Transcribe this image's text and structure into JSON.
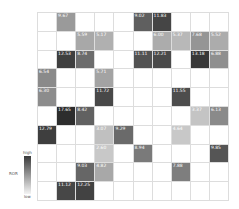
{
  "chart_data": {
    "type": "heatmap",
    "title": "",
    "rows": 10,
    "cols": 10,
    "colorbar": {
      "label": "ROR",
      "high_label": "high",
      "low_label": "low",
      "high_color": "#3a3a3a",
      "low_color": "#f4f4f4"
    },
    "cells": [
      {
        "r": 0,
        "c": 1,
        "v": "9.67",
        "shade": "#9a9a9a"
      },
      {
        "r": 0,
        "c": 5,
        "v": "9.02",
        "shade": "#5f5f5f"
      },
      {
        "r": 0,
        "c": 6,
        "v": "11.83",
        "shade": "#454545"
      },
      {
        "r": 1,
        "c": 2,
        "v": "5.59",
        "shade": "#a8a8a8"
      },
      {
        "r": 1,
        "c": 3,
        "v": "5.17",
        "shade": "#b0b0b0"
      },
      {
        "r": 1,
        "c": 6,
        "v": "6.00",
        "shade": "#acacac"
      },
      {
        "r": 1,
        "c": 7,
        "v": "5.37",
        "shade": "#b8b8b8"
      },
      {
        "r": 1,
        "c": 8,
        "v": "7.68",
        "shade": "#959595"
      },
      {
        "r": 1,
        "c": 9,
        "v": "5.52",
        "shade": "#acacac"
      },
      {
        "r": 2,
        "c": 1,
        "v": "12.53",
        "shade": "#3f3f3f"
      },
      {
        "r": 2,
        "c": 2,
        "v": "8.74",
        "shade": "#6c6c6c"
      },
      {
        "r": 2,
        "c": 5,
        "v": "11.11",
        "shade": "#525252"
      },
      {
        "r": 2,
        "c": 6,
        "v": "12.21",
        "shade": "#4a4a4a"
      },
      {
        "r": 2,
        "c": 8,
        "v": "13.18",
        "shade": "#383838"
      },
      {
        "r": 2,
        "c": 9,
        "v": "6.88",
        "shade": "#8f8f8f"
      },
      {
        "r": 3,
        "c": 0,
        "v": "6.54",
        "shade": "#8a8a8a"
      },
      {
        "r": 3,
        "c": 3,
        "v": "5.71",
        "shade": "#a3a3a3"
      },
      {
        "r": 4,
        "c": 0,
        "v": "6.30",
        "shade": "#8c8c8c"
      },
      {
        "r": 4,
        "c": 3,
        "v": "11.72",
        "shade": "#484848"
      },
      {
        "r": 4,
        "c": 7,
        "v": "11.55",
        "shade": "#4d4d4d"
      },
      {
        "r": 5,
        "c": 1,
        "v": "17.65",
        "shade": "#2d2d2d"
      },
      {
        "r": 5,
        "c": 2,
        "v": "8.42",
        "shade": "#616161"
      },
      {
        "r": 5,
        "c": 8,
        "v": "3.37",
        "shade": "#c4c4c4"
      },
      {
        "r": 5,
        "c": 9,
        "v": "6.13",
        "shade": "#8a8a8a"
      },
      {
        "r": 6,
        "c": 0,
        "v": "12.79",
        "shade": "#3e3e3e"
      },
      {
        "r": 6,
        "c": 3,
        "v": "3.07",
        "shade": "#c0c0c0"
      },
      {
        "r": 6,
        "c": 4,
        "v": "9.29",
        "shade": "#6a6a6a"
      },
      {
        "r": 6,
        "c": 7,
        "v": "4.64",
        "shade": "#c8c8c8"
      },
      {
        "r": 7,
        "c": 3,
        "v": "2.60",
        "shade": "#c8c8c8"
      },
      {
        "r": 7,
        "c": 5,
        "v": "8.94",
        "shade": "#7a7a7a"
      },
      {
        "r": 7,
        "c": 9,
        "v": "9.85",
        "shade": "#555555"
      },
      {
        "r": 8,
        "c": 2,
        "v": "9.03",
        "shade": "#666666"
      },
      {
        "r": 8,
        "c": 3,
        "v": "4.82",
        "shade": "#a8a8a8"
      },
      {
        "r": 8,
        "c": 7,
        "v": "7.88",
        "shade": "#7e7e7e"
      },
      {
        "r": 9,
        "c": 1,
        "v": "11.12",
        "shade": "#474747"
      },
      {
        "r": 9,
        "c": 2,
        "v": "12.25",
        "shade": "#424242"
      }
    ]
  }
}
